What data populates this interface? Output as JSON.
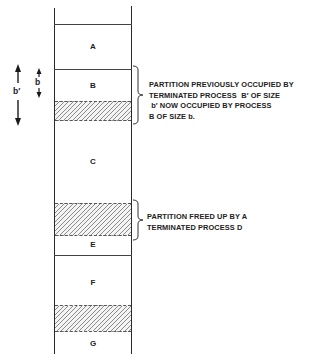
{
  "diagram": {
    "partitions": [
      {
        "id": "A",
        "label": "A",
        "top": 24,
        "bottom": 69,
        "free": false
      },
      {
        "id": "B",
        "label": "B",
        "top": 69,
        "bottom": 101,
        "free": false
      },
      {
        "id": "B-unused",
        "label": "",
        "top": 101,
        "bottom": 120,
        "free": true
      },
      {
        "id": "C",
        "label": "C",
        "top": 120,
        "bottom": 203,
        "free": false
      },
      {
        "id": "D-freed",
        "label": "",
        "top": 203,
        "bottom": 235,
        "free": true
      },
      {
        "id": "E",
        "label": "E",
        "top": 235,
        "bottom": 255,
        "free": false
      },
      {
        "id": "F",
        "label": "F",
        "top": 255,
        "bottom": 305,
        "free": false
      },
      {
        "id": "F-free",
        "label": "",
        "top": 305,
        "bottom": 331,
        "free": true
      },
      {
        "id": "G",
        "label": "G",
        "top": 331,
        "bottom": 353,
        "free": false
      }
    ],
    "dimensions": {
      "b_prime_label": "b′",
      "b_label": "b"
    },
    "annotations": [
      {
        "id": "annotation-b",
        "lines": [
          "PARTITION PREVIOUSLY OCCUPIED BY",
          "TERMINATED PROCESS  B′ OF SIZE",
          " b′ NOW OCCUPIED BY PROCESS",
          "B OF SIZE b."
        ]
      },
      {
        "id": "annotation-d",
        "lines": [
          "PARTITION FREED UP BY A",
          "TERMINATED PROCESS D"
        ]
      }
    ],
    "colors": {
      "line": "#2a2a2a",
      "hatch": "#8a8a8a",
      "background": "#ffffff"
    }
  }
}
